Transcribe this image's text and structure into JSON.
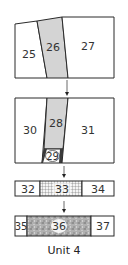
{
  "diagram": {
    "caption": "Unit 4",
    "colors": {
      "outline": "#2a2a2a",
      "shaded": "#d4d4d4",
      "mottled": "#a9a9a9",
      "grid": "#555555",
      "background": "#ffffff"
    },
    "steps": [
      {
        "step": 1,
        "pieces": [
          {
            "id": "25",
            "label": "25",
            "fill": "white"
          },
          {
            "id": "26",
            "label": "26",
            "fill": "shaded"
          },
          {
            "id": "27",
            "label": "27",
            "fill": "white"
          }
        ]
      },
      {
        "step": 2,
        "pieces": [
          {
            "id": "30",
            "label": "30",
            "fill": "white"
          },
          {
            "id": "28",
            "label": "28",
            "fill": "shaded"
          },
          {
            "id": "29",
            "label": "29",
            "fill": "small-print"
          },
          {
            "id": "31",
            "label": "31",
            "fill": "white"
          }
        ]
      },
      {
        "step": 3,
        "pieces": [
          {
            "id": "32",
            "label": "32",
            "fill": "white"
          },
          {
            "id": "33",
            "label": "33",
            "fill": "grid-pattern"
          },
          {
            "id": "34",
            "label": "34",
            "fill": "white"
          }
        ]
      },
      {
        "step": 4,
        "pieces": [
          {
            "id": "35",
            "label": "35",
            "fill": "white"
          },
          {
            "id": "36",
            "label": "36",
            "fill": "mottled-gray"
          },
          {
            "id": "37",
            "label": "37",
            "fill": "white"
          }
        ]
      }
    ],
    "arrows": [
      "down-arrow",
      "down-arrow",
      "down-arrow"
    ]
  }
}
